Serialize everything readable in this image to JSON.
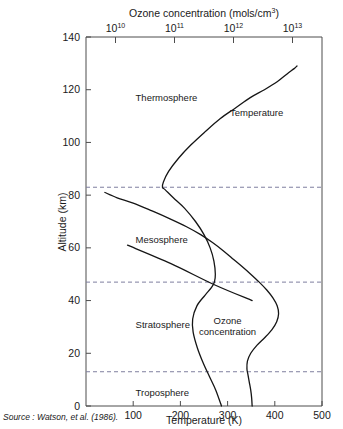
{
  "figure": {
    "source_note": "Source : Watson, et al. (1986)."
  },
  "chart_data": {
    "type": "line",
    "title": "",
    "xlabel": "Temperature (K)",
    "ylabel": "Altitude (km)",
    "top_axis_label": "Ozone concentration (mols/cm3)",
    "top_axis_label_plain": "Ozone concentration (mols/cm",
    "top_axis_label_exp": "3",
    "top_axis_label_tail": ")",
    "xlim": [
      0,
      500
    ],
    "ylim": [
      0,
      140
    ],
    "grid": false,
    "legend": "none",
    "x_ticks": [
      100,
      200,
      300,
      400,
      500
    ],
    "x_tick_labels": [
      "100",
      "200",
      "300",
      "400",
      "500"
    ],
    "y_ticks": [
      0,
      20,
      40,
      60,
      80,
      100,
      120,
      140
    ],
    "y_tick_labels": [
      "0",
      "20",
      "40",
      "60",
      "80",
      "100",
      "120",
      "140"
    ],
    "top_ticks_positions": [
      62.5,
      187.5,
      312.5,
      437.5
    ],
    "top_tick_bases": [
      "10",
      "10",
      "10",
      "10"
    ],
    "top_tick_exponents": [
      "10",
      "11",
      "12",
      "13"
    ],
    "boundaries": [
      {
        "name": "mesopause",
        "altitude": 83
      },
      {
        "name": "stratopause",
        "altitude": 47
      },
      {
        "name": "tropopause",
        "altitude": 13
      }
    ],
    "layer_labels": [
      {
        "name": "Thermosphere",
        "x": 105,
        "y": 117
      },
      {
        "name": "Mesosphere",
        "x": 105,
        "y": 63
      },
      {
        "name": "Stratosphere",
        "x": 105,
        "y": 31
      },
      {
        "name": "Troposphere",
        "x": 105,
        "y": 5
      }
    ],
    "series": [
      {
        "name": "Temperature",
        "label": "Temperature",
        "label_x": 305,
        "label_y": 110,
        "axis": "bottom",
        "unit": "K",
        "points": [
          [
            287,
            0
          ],
          [
            275,
            6
          ],
          [
            262,
            11
          ],
          [
            249,
            16
          ],
          [
            236,
            22
          ],
          [
            227,
            28
          ],
          [
            226,
            33
          ],
          [
            235,
            38
          ],
          [
            252,
            42
          ],
          [
            266,
            45
          ],
          [
            272,
            47
          ],
          [
            274,
            50
          ],
          [
            271,
            55
          ],
          [
            263,
            60
          ],
          [
            250,
            65
          ],
          [
            232,
            70
          ],
          [
            209,
            75
          ],
          [
            185,
            79
          ],
          [
            168,
            82
          ],
          [
            162,
            83
          ],
          [
            164,
            85
          ],
          [
            175,
            89
          ],
          [
            196,
            94
          ],
          [
            222,
            99
          ],
          [
            252,
            104
          ],
          [
            284,
            109
          ],
          [
            316,
            113
          ],
          [
            348,
            117
          ],
          [
            378,
            120
          ],
          [
            405,
            123
          ],
          [
            426,
            126
          ],
          [
            441,
            128
          ],
          [
            447,
            129
          ]
        ]
      },
      {
        "name": "Ozone concentration",
        "label": "Ozone concentration",
        "label_line1": "Ozone",
        "label_line2": "concentration",
        "label_x": 300,
        "label_y": 31,
        "axis": "top",
        "unit": "mols/cm3",
        "points": [
          [
            352,
            0
          ],
          [
            351,
            3
          ],
          [
            349,
            6
          ],
          [
            346,
            9
          ],
          [
            343,
            12
          ],
          [
            341,
            14
          ],
          [
            342,
            17
          ],
          [
            349,
            20
          ],
          [
            362,
            23
          ],
          [
            379,
            26
          ],
          [
            394,
            29
          ],
          [
            404,
            32
          ],
          [
            408,
            35
          ],
          [
            405,
            38
          ],
          [
            396,
            41
          ],
          [
            383,
            44
          ],
          [
            367,
            47
          ],
          [
            349,
            50
          ],
          [
            330,
            53
          ],
          [
            310,
            56
          ],
          [
            290,
            59
          ],
          [
            268,
            62
          ],
          [
            243,
            65
          ],
          [
            213,
            68
          ],
          [
            178,
            71
          ],
          [
            140,
            74
          ],
          [
            100,
            77
          ],
          [
            66,
            79
          ],
          [
            40,
            81
          ]
        ]
      },
      {
        "name": "Mesosphere boundary segment",
        "label": "",
        "axis": "bottom",
        "points": [
          [
            88,
            61
          ],
          [
            180,
            54
          ],
          [
            272,
            46
          ],
          [
            352,
            40
          ]
        ]
      }
    ]
  }
}
